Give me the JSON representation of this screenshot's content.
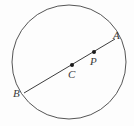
{
  "figure": {
    "background_color": "#fdfdfd",
    "stroke_color": "#555555",
    "label_color": "#3a3a3a",
    "dot_color": "#1a1a1a",
    "width": 134,
    "height": 126
  },
  "circle": {
    "name": "circle",
    "center_x": 69,
    "center_y": 62,
    "radius": 57,
    "stroke_width": 1
  },
  "chord": {
    "name": "diameter-line-AB",
    "x1": 24,
    "y1": 93,
    "x2": 115,
    "y2": 39,
    "stroke_width": 1
  },
  "points": [
    {
      "id": "A",
      "label": "A",
      "dot": false,
      "dot_x": 114,
      "dot_y": 40,
      "label_x": 113,
      "label_y": 30,
      "description": "endpoint on circle, upper right"
    },
    {
      "id": "P",
      "label": "P",
      "dot": true,
      "dot_x": 94,
      "dot_y": 52,
      "label_x": 90,
      "label_y": 56,
      "description": "point on segment between center and A"
    },
    {
      "id": "C",
      "label": "C",
      "dot": true,
      "dot_x": 72,
      "dot_y": 65,
      "label_x": 68,
      "label_y": 69,
      "description": "center of circle"
    },
    {
      "id": "B",
      "label": "B",
      "dot": false,
      "dot_x": 24,
      "dot_y": 93,
      "label_x": 13,
      "label_y": 88,
      "description": "endpoint on circle, lower left"
    }
  ]
}
